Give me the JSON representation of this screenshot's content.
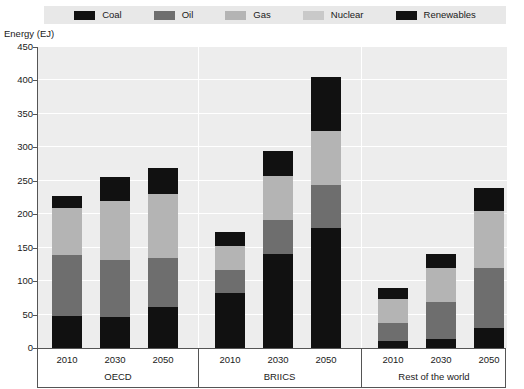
{
  "chart_data": {
    "type": "bar",
    "subtype": "stacked-bar-grouped",
    "title": "",
    "xlabel": "",
    "ylabel": "Energy (EJ)",
    "ylim": [
      0,
      450
    ],
    "ytick_step": 50,
    "yticks": [
      0,
      50,
      100,
      150,
      200,
      250,
      300,
      350,
      400,
      450
    ],
    "grid": true,
    "legend_position": "top",
    "groups": [
      "OECD",
      "BRIICS",
      "Rest of the world"
    ],
    "categories": [
      "2010",
      "2030",
      "2050"
    ],
    "series": [
      {
        "name": "Coal",
        "color": "#111111",
        "values": {
          "OECD": [
            48,
            47,
            61
          ],
          "BRIICS": [
            82,
            141,
            179
          ],
          "Rest of the world": [
            10,
            14,
            30
          ]
        }
      },
      {
        "name": "Oil",
        "color": "#6e6e6e",
        "values": {
          "OECD": [
            91,
            85,
            74
          ],
          "BRIICS": [
            35,
            50,
            65
          ],
          "Rest of the world": [
            28,
            55,
            90
          ]
        }
      },
      {
        "name": "Gas",
        "color": "#b4b4b4",
        "values": {
          "OECD": [
            70,
            88,
            96
          ],
          "BRIICS": [
            36,
            66,
            80
          ],
          "Rest of the world": [
            35,
            50,
            85
          ]
        }
      },
      {
        "name": "Nuclear",
        "color": "#9e9e9e",
        "values": {
          "OECD": [
            0,
            0,
            0
          ],
          "BRIICS": [
            0,
            0,
            0
          ],
          "Rest of the world": [
            0,
            0,
            0
          ]
        }
      },
      {
        "name": "Renewables",
        "color": "#111111",
        "values": {
          "OECD": [
            18,
            35,
            38
          ],
          "BRIICS": [
            21,
            38,
            81
          ],
          "Rest of the world": [
            17,
            21,
            35
          ]
        }
      }
    ],
    "totals": {
      "OECD": [
        227,
        255,
        269
      ],
      "BRIICS": [
        174,
        295,
        405
      ],
      "Rest of the world": [
        90,
        140,
        240
      ]
    }
  },
  "legend": {
    "items": [
      {
        "label": "Coal",
        "color": "#111111"
      },
      {
        "label": "Oil",
        "color": "#6e6e6e"
      },
      {
        "label": "Gas",
        "color": "#b4b4b4"
      },
      {
        "label": "Nuclear",
        "color": "#c9c9c9"
      },
      {
        "label": "Renewables",
        "color": "#111111"
      }
    ]
  },
  "axes": {
    "y_title": "Energy (EJ)",
    "y_labels": [
      "450",
      "400",
      "350",
      "300",
      "250",
      "200",
      "150",
      "100",
      "50",
      "0"
    ],
    "x_labels": [
      "2010",
      "2030",
      "2050",
      "2010",
      "2030",
      "2050",
      "2010",
      "2030",
      "2050"
    ],
    "group_labels": [
      "OECD",
      "BRIICS",
      "Rest of the world"
    ]
  }
}
